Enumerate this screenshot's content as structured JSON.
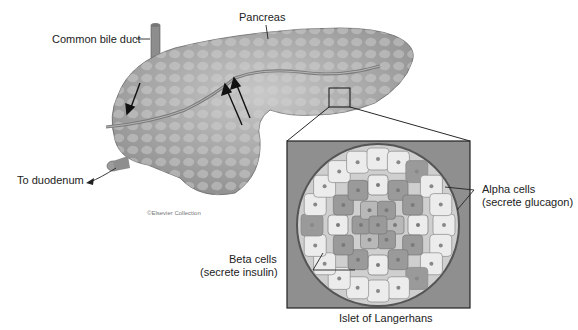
{
  "labels": {
    "common_bile_duct": "Common bile duct",
    "pancreas": "Pancreas",
    "to_duodenum": "To duodenum",
    "copyright": "©Elsevier Collection",
    "alpha_cells_line1": "Alpha cells",
    "alpha_cells_line2": "(secrete glucagon)",
    "beta_cells_line1": "Beta cells",
    "beta_cells_line2": "(secrete insulin)",
    "islet_caption": "Islet of Langerhans"
  },
  "colors": {
    "pancreas_fill": "#a9a9a9",
    "islet_bg": "#8f8f8f",
    "alpha_cell": "#ececec",
    "beta_cell": "#9a9a9a",
    "line": "#222222"
  }
}
